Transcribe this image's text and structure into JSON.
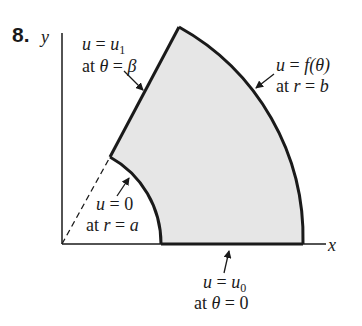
{
  "problem_number": "8.",
  "axes": {
    "x_label": "x",
    "y_label": "y"
  },
  "labels": {
    "top_left": {
      "line1_var": "u",
      "line1_eq": " = ",
      "line1_val": "u",
      "line1_sub": "1",
      "line2_at": "at ",
      "line2_var": "θ",
      "line2_eq": " = ",
      "line2_val": "β"
    },
    "top_right": {
      "line1_var": "u",
      "line1_eq": " = ",
      "line1_val": "f(θ)",
      "line2_at": "at ",
      "line2_var": "r",
      "line2_eq": " = ",
      "line2_val": "b"
    },
    "inner": {
      "line1_var": "u",
      "line1_eq": " = 0",
      "line2_at": "at ",
      "line2_var": "r",
      "line2_eq": " = ",
      "line2_val": "a"
    },
    "bottom": {
      "line1_var": "u",
      "line1_eq": " = ",
      "line1_val": "u",
      "line1_sub": "0",
      "line2_at": "at ",
      "line2_var": "θ",
      "line2_eq": " = 0"
    }
  },
  "colors": {
    "region_fill": "#e6e6e6",
    "stroke": "#1a1a1a"
  }
}
